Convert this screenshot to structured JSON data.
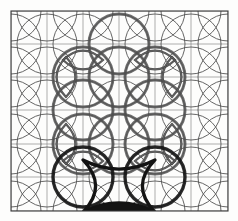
{
  "figure": {
    "name": "circle-lattice-diagram",
    "background_color": "#fdfdfc",
    "frame": {
      "x": 11,
      "y": 11,
      "width": 217,
      "height": 200,
      "stroke": "#3a3a3a",
      "stroke_width": 1.1
    },
    "grid": {
      "stroke": "#8b8b8b",
      "stroke_width": 0.7,
      "x_lines": [
        11,
        47,
        83,
        119,
        155,
        191,
        228
      ],
      "y_lines": [
        11,
        44,
        77,
        110,
        144,
        177,
        211
      ]
    },
    "circles": {
      "radius": 30,
      "faint": {
        "stroke": "#4a4a4a",
        "stroke_width": 0.85,
        "centers": [
          [
            11,
            11
          ],
          [
            47,
            11
          ],
          [
            83,
            11
          ],
          [
            119,
            11
          ],
          [
            155,
            11
          ],
          [
            191,
            11
          ],
          [
            228,
            11
          ],
          [
            11,
            44
          ],
          [
            47,
            44
          ],
          [
            83,
            44
          ],
          [
            119,
            44
          ],
          [
            155,
            44
          ],
          [
            191,
            44
          ],
          [
            228,
            44
          ],
          [
            11,
            77
          ],
          [
            47,
            77
          ],
          [
            83,
            77
          ],
          [
            119,
            77
          ],
          [
            155,
            77
          ],
          [
            191,
            77
          ],
          [
            228,
            77
          ],
          [
            11,
            110
          ],
          [
            47,
            110
          ],
          [
            83,
            110
          ],
          [
            119,
            110
          ],
          [
            155,
            110
          ],
          [
            191,
            110
          ],
          [
            228,
            110
          ],
          [
            11,
            144
          ],
          [
            47,
            144
          ],
          [
            83,
            144
          ],
          [
            119,
            144
          ],
          [
            155,
            144
          ],
          [
            191,
            144
          ],
          [
            228,
            144
          ],
          [
            11,
            177
          ],
          [
            47,
            177
          ],
          [
            83,
            177
          ],
          [
            119,
            177
          ],
          [
            155,
            177
          ],
          [
            191,
            177
          ],
          [
            228,
            177
          ],
          [
            11,
            211
          ],
          [
            47,
            211
          ],
          [
            83,
            211
          ],
          [
            119,
            211
          ],
          [
            155,
            211
          ],
          [
            191,
            211
          ],
          [
            228,
            211
          ]
        ]
      },
      "bold": {
        "stroke": "#4f4f4f",
        "stroke_width": 3.0,
        "centers": [
          [
            83,
            77
          ],
          [
            119,
            77
          ],
          [
            155,
            77
          ],
          [
            83,
            110
          ],
          [
            155,
            110
          ],
          [
            83,
            144
          ],
          [
            119,
            144
          ],
          [
            155,
            144
          ],
          [
            119,
            44
          ]
        ]
      },
      "emphasis_dark": {
        "stroke": "#151515",
        "stroke_width": 3.4,
        "centers": [
          [
            83,
            177
          ],
          [
            155,
            177
          ]
        ]
      }
    },
    "lenses": [
      {
        "name": "lens-top-left",
        "cx": 83,
        "cy": 60,
        "rx": 20,
        "ry": 9,
        "orient": "horizontal"
      },
      {
        "name": "lens-top-right",
        "cx": 155,
        "cy": 60,
        "rx": 20,
        "ry": 9,
        "orient": "horizontal"
      },
      {
        "name": "lens-bottom-left",
        "cx": 83,
        "cy": 161,
        "rx": 20,
        "ry": 9,
        "orient": "horizontal"
      },
      {
        "name": "lens-bottom-right",
        "cx": 155,
        "cy": 161,
        "rx": 20,
        "ry": 9,
        "orient": "horizontal"
      },
      {
        "name": "lens-left-upper",
        "cx": 66,
        "cy": 77,
        "rx": 9,
        "ry": 20,
        "orient": "vertical"
      },
      {
        "name": "lens-left-lower",
        "cx": 66,
        "cy": 144,
        "rx": 9,
        "ry": 20,
        "orient": "vertical"
      },
      {
        "name": "lens-right-upper",
        "cx": 172,
        "cy": 77,
        "rx": 9,
        "ry": 20,
        "orient": "vertical"
      },
      {
        "name": "lens-right-lower",
        "cx": 172,
        "cy": 144,
        "rx": 9,
        "ry": 20,
        "orient": "vertical"
      }
    ],
    "dark_region": {
      "name": "astroid-cusp-region",
      "fill": "#131313",
      "stroke": "#131313",
      "stroke_width": 3.2,
      "center_x": 119,
      "center_y": 186,
      "half_width": 36,
      "half_height": 26
    },
    "labels": {
      "caption": "",
      "title": ""
    }
  }
}
